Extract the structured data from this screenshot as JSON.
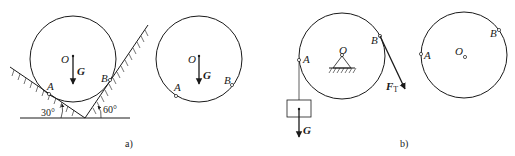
{
  "figure_a": {
    "caption": "a)",
    "diagram1": {
      "center_label": "O",
      "weight_label": "G",
      "point_a": "A",
      "point_b": "B",
      "angle_left": "30°",
      "angle_right": "60°"
    },
    "diagram2": {
      "center_label": "O",
      "weight_label": "G",
      "point_a": "A",
      "point_b": "B"
    }
  },
  "figure_b": {
    "caption": "b)",
    "diagram1": {
      "center_label": "O",
      "weight_label": "G",
      "point_a": "A",
      "point_b": "B",
      "tension_label": "F",
      "tension_subscript": "T"
    },
    "diagram2": {
      "center_label": "O",
      "point_a": "A",
      "point_b": "B"
    }
  },
  "colors": {
    "stroke": "#1a1a1a",
    "background": "#ffffff"
  }
}
